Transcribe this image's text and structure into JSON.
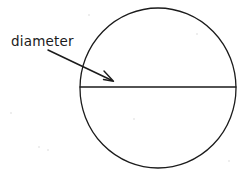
{
  "figure": {
    "background_color": "#ffffff",
    "ink_color": "#1b1b1b",
    "width": 249,
    "height": 177
  },
  "label": {
    "text": "diameter",
    "x": 11,
    "y": 46,
    "font_size": 13.5
  },
  "circle": {
    "name": "circle",
    "center_x": 158,
    "center_y": 88,
    "radius": 78,
    "stroke_width": 1.3
  },
  "diameter_line": {
    "name": "diameter-line",
    "x1": 80,
    "y1": 87,
    "x2": 236,
    "y2": 87,
    "stroke_width": 1.3
  },
  "leader_arrow": {
    "name": "leader-arrow",
    "x1": 48,
    "y1": 50,
    "x2": 113,
    "y2": 81,
    "arrowhead_path": "M 104 71 L 113.5 81.2 L 103.5 79.5",
    "stroke_width": 1.5
  },
  "specks": [
    {
      "x": 10,
      "y": 112,
      "size": 2
    },
    {
      "x": 38,
      "y": 146,
      "size": 2
    },
    {
      "x": 47,
      "y": 149,
      "size": 2
    },
    {
      "x": 196,
      "y": 33,
      "size": 2
    },
    {
      "x": 133,
      "y": 118,
      "size": 2
    },
    {
      "x": 88,
      "y": 14,
      "size": 2
    },
    {
      "x": 228,
      "y": 160,
      "size": 2
    }
  ]
}
